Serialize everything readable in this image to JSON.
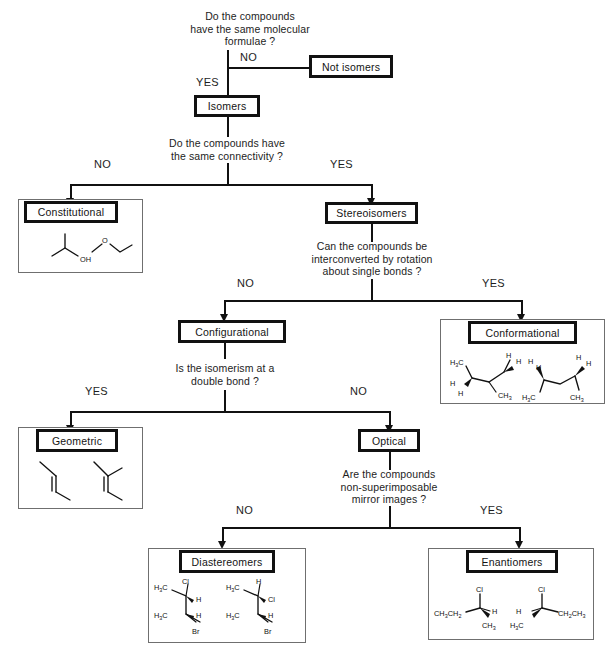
{
  "questions": {
    "q1": "Do the compounds\nhave the same molecular\nformulae ?",
    "q2": "Do the compounds have\nthe same connectivity ?",
    "q3": "Can the compounds be\ninterconverted by rotation\nabout single bonds ?",
    "q4": "Is the isomerism at a\ndouble bond ?",
    "q5": "Are the compounds\nnon-superimposable\nmirror images ?"
  },
  "edges": {
    "q1_no": "NO",
    "q1_yes": "YES",
    "q2_no": "NO",
    "q2_yes": "YES",
    "q3_no": "NO",
    "q3_yes": "YES",
    "q4_yes": "YES",
    "q4_no": "NO",
    "q5_no": "NO",
    "q5_yes": "YES"
  },
  "nodes": {
    "not_isomers": "Not isomers",
    "isomers": "Isomers",
    "constitutional": "Constitutional",
    "stereoisomers": "Stereoisomers",
    "configurational": "Configurational",
    "conformational": "Conformational",
    "geometric": "Geometric",
    "optical": "Optical",
    "diastereomers": "Diastereomers",
    "enantiomers": "Enantiomers"
  },
  "structures": {
    "constitutional": {
      "left_labels": [
        "OH"
      ],
      "right_labels": [
        "O"
      ]
    },
    "conformational": {
      "left_labels": [
        "H",
        "C",
        "H",
        "H",
        "H",
        "C",
        "CH",
        "3",
        "3"
      ],
      "right_labels": [
        "H",
        "H",
        "H",
        "C",
        "CH",
        "3",
        "3"
      ]
    },
    "diastereomers": {
      "left_labels": [
        "H",
        "C",
        "Cl",
        "H",
        "H",
        "C",
        "H",
        "Br",
        "3",
        "3"
      ],
      "right_labels": [
        "H",
        "C",
        "H",
        "Cl",
        "H",
        "C",
        "H",
        "Br",
        "3",
        "3"
      ]
    },
    "enantiomers": {
      "left_labels": [
        "Cl",
        "CH",
        "CH",
        "H",
        "CH",
        "3",
        "2",
        "3"
      ],
      "right_labels": [
        "Cl",
        "H",
        "H",
        "C",
        "CH",
        "CH",
        "3",
        "2",
        "3"
      ]
    }
  },
  "colors": {
    "ink": "#111111",
    "panel_border": "#6f6f6f",
    "background": "#ffffff"
  }
}
